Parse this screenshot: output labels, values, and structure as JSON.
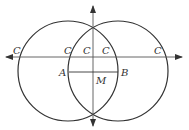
{
  "diagram": {
    "type": "geometric construction",
    "circles": [
      {
        "name": "left-circle",
        "cx": 68,
        "cy": 71,
        "r": 50
      },
      {
        "name": "right-circle",
        "cx": 118,
        "cy": 71,
        "r": 50
      }
    ],
    "lines": [
      {
        "name": "horizontal-axis",
        "arrows": "both"
      },
      {
        "name": "vertical-axis",
        "arrows": "both"
      },
      {
        "name": "segment-AB"
      }
    ],
    "labels": {
      "c_far_left": "C",
      "c_inner_left": "C",
      "c_center_left": "C",
      "c_center_right": "C",
      "c_far_right": "C",
      "a": "A",
      "b": "B",
      "m": "M"
    },
    "colors": {
      "stroke": "#333333",
      "background": "#ffffff"
    }
  }
}
